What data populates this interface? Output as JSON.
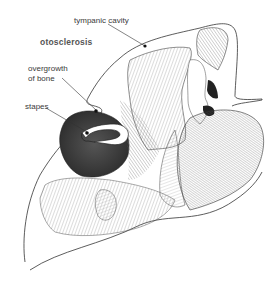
{
  "diagram": {
    "title": "otosclerosis",
    "labels": {
      "tympanic_cavity": "tympanic cavity",
      "overgrowth_line1": "overgrowth",
      "overgrowth_line2": "of bone",
      "stapes": "stapes"
    },
    "colors": {
      "line": "#333333",
      "dark_fill": "#2a2a2a",
      "mid_fill": "#6f6f6f",
      "hatch": "#8a8a8a",
      "text": "#3a3a3a",
      "background": "#ffffff"
    }
  }
}
